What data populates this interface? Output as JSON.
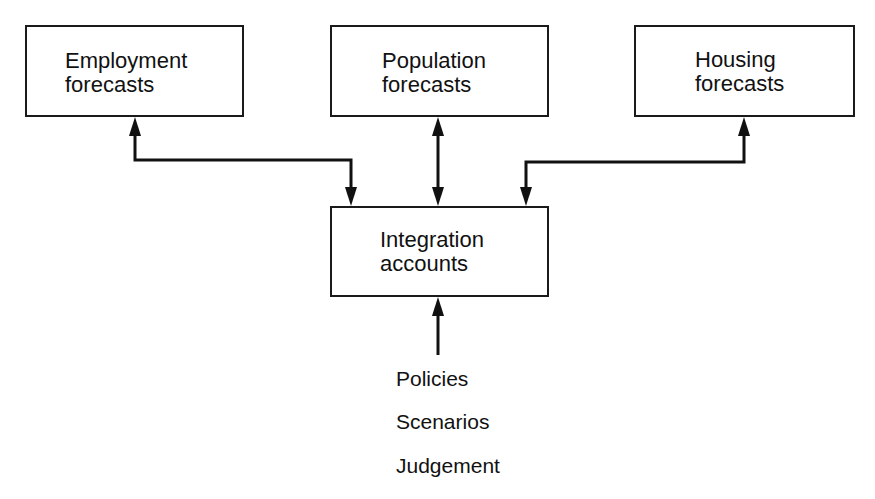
{
  "diagram": {
    "boxes": {
      "employment": {
        "line1": "Employment",
        "line2": "forecasts"
      },
      "population": {
        "line1": "Population",
        "line2": "forecasts"
      },
      "housing": {
        "line1": "Housing",
        "line2": "forecasts"
      },
      "integration": {
        "line1": "Integration",
        "line2": "accounts"
      }
    },
    "inputs": [
      "Policies",
      "Scenarios",
      "Judgement"
    ],
    "edges": [
      {
        "from": "integration",
        "to": "employment",
        "type": "single-arrow-each-end"
      },
      {
        "from": "population",
        "to": "integration",
        "type": "bidirectional"
      },
      {
        "from": "housing",
        "to": "integration",
        "type": "single-arrow-each-end"
      },
      {
        "from": "inputs",
        "to": "integration",
        "type": "arrow"
      }
    ]
  }
}
